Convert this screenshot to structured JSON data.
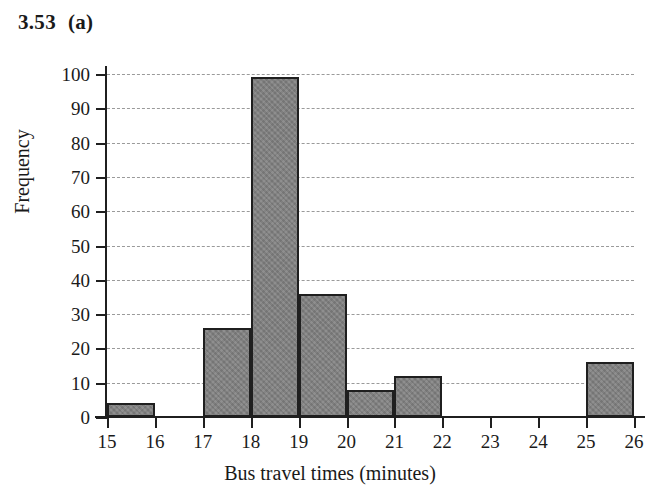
{
  "figure": {
    "number": "3.53",
    "part": "(a)"
  },
  "chart_data": {
    "type": "bar",
    "xlabel": "Bus travel times (minutes)",
    "ylabel": "Frequency",
    "grid": true,
    "legend": false,
    "xlim": [
      15,
      26
    ],
    "ylim": [
      0,
      100
    ],
    "x_tick_labels": [
      "15",
      "16",
      "17",
      "18",
      "19",
      "20",
      "21",
      "22",
      "23",
      "24",
      "25",
      "26"
    ],
    "y_tick_labels": [
      "0",
      "10",
      "20",
      "30",
      "40",
      "50",
      "60",
      "70",
      "80",
      "90",
      "100"
    ],
    "y_ticks": [
      0,
      10,
      20,
      30,
      40,
      50,
      60,
      70,
      80,
      90,
      100
    ],
    "bin_edges": [
      15,
      16,
      17,
      18,
      19,
      20,
      21,
      22,
      23,
      24,
      25,
      26
    ],
    "categories": [
      "15-16",
      "16-17",
      "17-18",
      "18-19",
      "19-20",
      "20-21",
      "21-22",
      "22-23",
      "23-24",
      "24-25",
      "25-26"
    ],
    "values": [
      4,
      0,
      26,
      99,
      36,
      8,
      12,
      0,
      0,
      0,
      16
    ],
    "colors": {
      "bar_fill": "#808080",
      "bar_edge": "#1f1f1f",
      "gridline": "#9a9a9a",
      "axis": "#1f1f1f",
      "background": "#ffffff"
    }
  }
}
